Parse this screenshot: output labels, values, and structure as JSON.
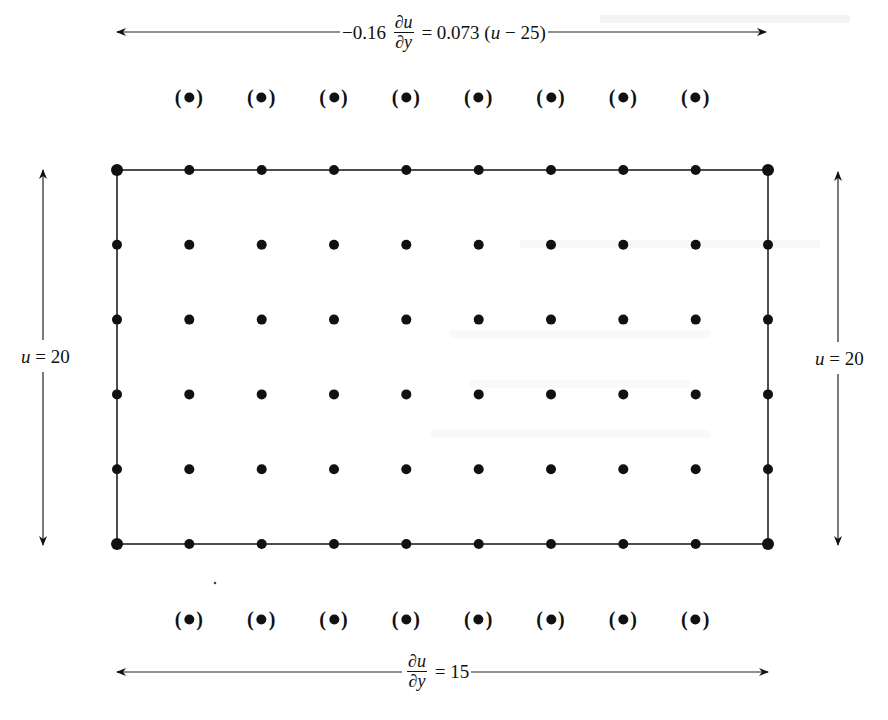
{
  "diagram": {
    "type": "finite-difference-grid",
    "grid": {
      "columns": 10,
      "rows": 6,
      "x_start": 117,
      "x_end": 768,
      "y_start": 170,
      "y_end": 544,
      "node_radius": 5,
      "node_color": "#111111",
      "line_color": "#222222"
    },
    "ghost_nodes": {
      "label": "(•)",
      "top_row_y": 97,
      "bottom_row_y": 619,
      "column_indices": [
        1,
        2,
        3,
        4,
        5,
        6,
        7,
        8
      ]
    },
    "boundary_conditions": {
      "top": {
        "coefficient": "−0.16",
        "numerator": "∂u",
        "denominator": "∂y",
        "equals": "=",
        "rhs": "0.073 (",
        "rhs_var": "u",
        "rhs_tail": " − 25)"
      },
      "bottom": {
        "numerator": "∂u",
        "denominator": "∂y",
        "equals": "=",
        "rhs": "15"
      },
      "left": {
        "var": "u",
        "equals": "=",
        "value": "20"
      },
      "right": {
        "var": "u",
        "equals": "=",
        "value": "20"
      }
    },
    "arrows": {
      "top": {
        "y": 32,
        "x1": 117,
        "x2": 766
      },
      "bottom": {
        "y": 672,
        "x1": 117,
        "x2": 768
      },
      "left": {
        "x": 43,
        "y1": 170,
        "y2": 545
      },
      "right": {
        "x": 838,
        "y1": 172,
        "y2": 545
      }
    }
  }
}
